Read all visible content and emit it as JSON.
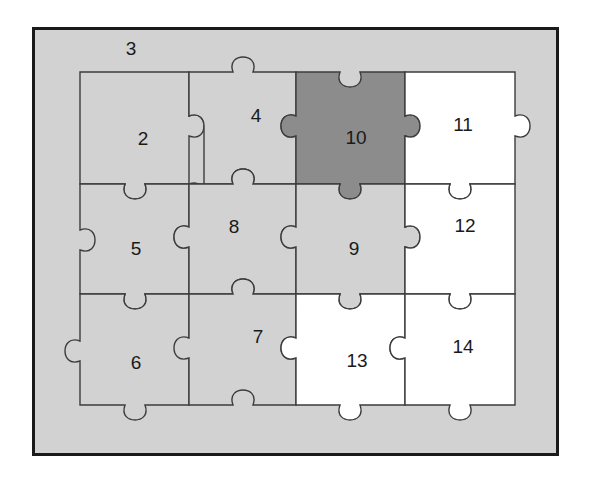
{
  "figure": {
    "kind": "jigsaw-puzzle-diagram",
    "grid": {
      "cols": 4,
      "rows": 3
    },
    "colors": {
      "page_background": "#ffffff",
      "frame_border": "#1a1a1a",
      "tray_background": "#d2d2d2",
      "piece_light_gray": "#d2d2d2",
      "piece_dark_gray": "#8c8c8c",
      "piece_white": "#ffffff",
      "piece_outline": "#3c3c3c",
      "label_text": "#1a1a1a"
    },
    "labels": [
      {
        "id": "label-3",
        "text": "3",
        "x": 131,
        "y": 50,
        "region": "tray-background-above-grid"
      },
      {
        "id": "label-2",
        "text": "2",
        "x": 143,
        "y": 140,
        "region": "piece-r1c1"
      },
      {
        "id": "label-4",
        "text": "4",
        "x": 256,
        "y": 117,
        "region": "piece-r1c2"
      },
      {
        "id": "label-10",
        "text": "10",
        "x": 356,
        "y": 139,
        "region": "piece-r1c3"
      },
      {
        "id": "label-11",
        "text": "11",
        "x": 463,
        "y": 126,
        "region": "piece-r1c4"
      },
      {
        "id": "label-5",
        "text": "5",
        "x": 136,
        "y": 250,
        "region": "piece-r2c1"
      },
      {
        "id": "label-8",
        "text": "8",
        "x": 234,
        "y": 228,
        "region": "piece-r2c2"
      },
      {
        "id": "label-9",
        "text": "9",
        "x": 354,
        "y": 250,
        "region": "piece-r2c3"
      },
      {
        "id": "label-12",
        "text": "12",
        "x": 465,
        "y": 227,
        "region": "piece-r2c4"
      },
      {
        "id": "label-6",
        "text": "6",
        "x": 136,
        "y": 364,
        "region": "piece-r3c1"
      },
      {
        "id": "label-7",
        "text": "7",
        "x": 258,
        "y": 338,
        "region": "piece-r3c2"
      },
      {
        "id": "label-13",
        "text": "13",
        "x": 357,
        "y": 362,
        "region": "piece-r3c3"
      },
      {
        "id": "label-14",
        "text": "14",
        "x": 463,
        "y": 348,
        "region": "piece-r3c4"
      }
    ],
    "pieces": [
      {
        "id": "piece-2",
        "number": "2",
        "row": 1,
        "col": 1,
        "fill": "light-gray"
      },
      {
        "id": "piece-4",
        "number": "4",
        "row": 1,
        "col": 2,
        "fill": "light-gray"
      },
      {
        "id": "piece-10",
        "number": "10",
        "row": 1,
        "col": 3,
        "fill": "dark-gray"
      },
      {
        "id": "piece-11",
        "number": "11",
        "row": 1,
        "col": 4,
        "fill": "white"
      },
      {
        "id": "piece-5",
        "number": "5",
        "row": 2,
        "col": 1,
        "fill": "light-gray"
      },
      {
        "id": "piece-8",
        "number": "8",
        "row": 2,
        "col": 2,
        "fill": "light-gray"
      },
      {
        "id": "piece-9",
        "number": "9",
        "row": 2,
        "col": 3,
        "fill": "light-gray"
      },
      {
        "id": "piece-12",
        "number": "12",
        "row": 2,
        "col": 4,
        "fill": "white"
      },
      {
        "id": "piece-6",
        "number": "6",
        "row": 3,
        "col": 1,
        "fill": "light-gray"
      },
      {
        "id": "piece-7",
        "number": "7",
        "row": 3,
        "col": 2,
        "fill": "light-gray"
      },
      {
        "id": "piece-13",
        "number": "13",
        "row": 3,
        "col": 3,
        "fill": "white"
      },
      {
        "id": "piece-14",
        "number": "14",
        "row": 3,
        "col": 4,
        "fill": "white"
      }
    ]
  }
}
